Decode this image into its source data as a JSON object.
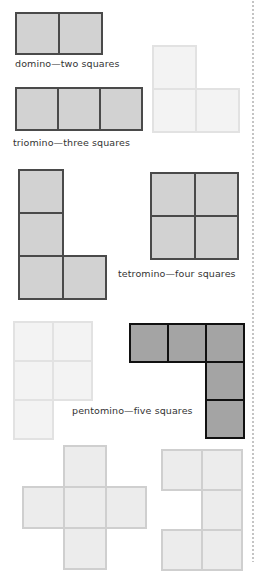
{
  "labels": {
    "domino": "domino—two squares",
    "triomino": "triomino—three squares",
    "tetromino": "tetromino—four squares",
    "pentomino": "pentomino—five squares"
  },
  "colors": {
    "mid_fill": "#d2d2d2",
    "mid_border": "#4a4a4a",
    "light_fill": "#f3f3f3",
    "light_border": "#e2e2e2",
    "pale_fill": "#ececec",
    "pale_border": "#cfcfcf",
    "dark_fill": "#a4a4a4",
    "dark_border": "#111111"
  },
  "shapes": [
    {
      "name": "domino",
      "squares": 2,
      "style": "mid"
    },
    {
      "name": "triomino-straight",
      "squares": 3,
      "style": "mid"
    },
    {
      "name": "triomino-l",
      "squares": 3,
      "style": "light"
    },
    {
      "name": "tetromino-l",
      "squares": 4,
      "style": "mid"
    },
    {
      "name": "tetromino-square",
      "squares": 4,
      "style": "mid"
    },
    {
      "name": "pentomino-p",
      "squares": 5,
      "style": "light"
    },
    {
      "name": "pentomino-l",
      "squares": 5,
      "style": "dark"
    },
    {
      "name": "pentomino-plus",
      "squares": 5,
      "style": "pale"
    },
    {
      "name": "pentomino-c",
      "squares": 5,
      "style": "pale"
    }
  ]
}
